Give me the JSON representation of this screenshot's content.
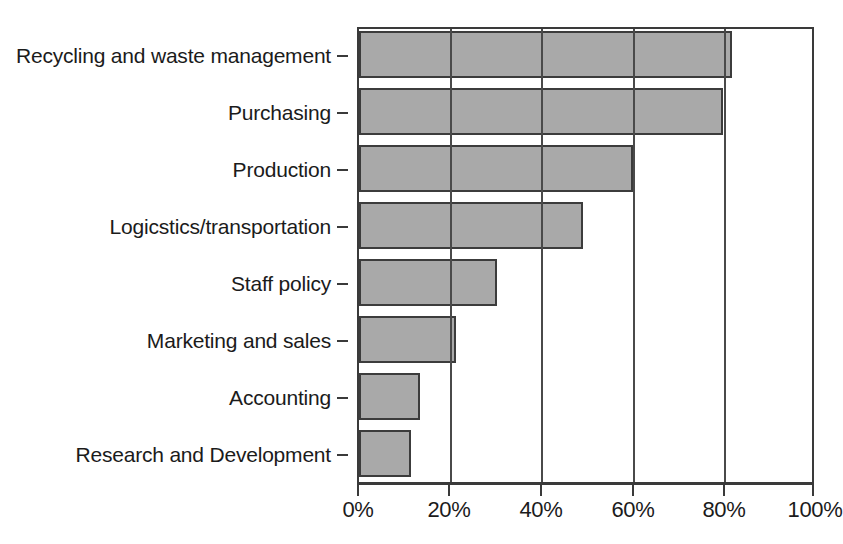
{
  "chart_data": {
    "type": "bar",
    "orientation": "horizontal",
    "title": "",
    "subtitle": "",
    "xlabel": "",
    "ylabel": "",
    "xlim": [
      0,
      100
    ],
    "grid": true,
    "legend": null,
    "bar_color": "#a9a9a9",
    "bar_edge_color": "#3c3c3c",
    "axis_color": "#3a3a3a",
    "categories": [
      "Recycling and waste management",
      "Purchasing",
      "Production",
      "Logicstics/transportation",
      "Staff policy",
      "Marketing and sales",
      "Accounting",
      "Research and Development"
    ],
    "values": [
      82,
      80,
      60,
      49,
      30,
      21,
      13,
      11
    ],
    "value_unit": "%",
    "xticks": [
      0,
      20,
      40,
      60,
      80,
      100
    ],
    "xticklabels": [
      "0%",
      "20%",
      "40%",
      "60%",
      "80%",
      "100%"
    ]
  }
}
